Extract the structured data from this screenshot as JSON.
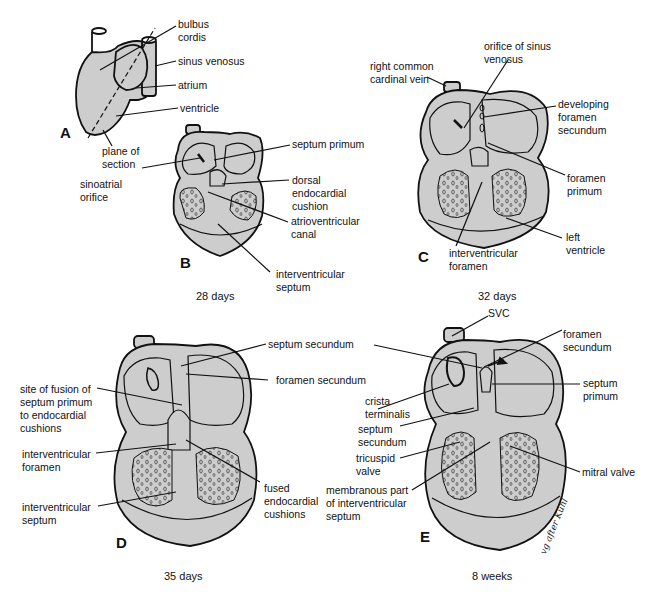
{
  "figure": {
    "fill_color": "#cdcdcd",
    "stroke_color": "#111111"
  },
  "panels": {
    "A": {
      "letter": "A",
      "labels": {
        "bulbus_cordis": "bulbus\ncordis",
        "sinus_venosus": "sinus venosus",
        "atrium": "atrium",
        "ventricle": "ventricle",
        "plane_of_section": "plane of\nsection"
      }
    },
    "B": {
      "letter": "B",
      "caption": "28 days",
      "labels": {
        "septum_primum": "septum primum",
        "sinoatrial_orifice": "sinoatrial\norifice",
        "dorsal_endocardial_cushion": "dorsal\nendocardial\ncushion",
        "atrioventricular_canal": "atrioventricular\ncanal",
        "interventricular_septum": "interventricular\nseptum"
      }
    },
    "C": {
      "letter": "C",
      "caption": "32 days",
      "labels": {
        "right_common_cardinal_vein": "right common\ncardinal vein",
        "orifice_of_sinus_venosus": "orifice of sinus\nvenosus",
        "developing_foramen_secundum": "developing\nforamen\nsecundum",
        "foramen_primum": "foramen\nprimum",
        "left_ventricle": "left\nventricle",
        "interventricular_foramen": "interventricular\nforamen"
      }
    },
    "D": {
      "letter": "D",
      "caption": "35 days",
      "labels": {
        "septum_secundum": "septum secundum",
        "foramen_secundum": "foramen secundum",
        "site_of_fusion": "site of fusion of\nseptum primum\nto endocardial\ncushions",
        "interventricular_foramen": "interventricular\nforamen",
        "interventricular_septum": "interventricular\nseptum",
        "fused_endocardial_cushions": "fused\nendocardial\ncushions"
      }
    },
    "E": {
      "letter": "E",
      "caption": "8 weeks",
      "signature": "vg after Kuhl",
      "labels": {
        "svc": "SVC",
        "foramen_secundum": "foramen\nsecundum",
        "septum_primum": "septum\nprimum",
        "crista_terminalis": "crista\nterminalis",
        "septum_secundum": "septum\nsecundum",
        "tricuspid_valve": "tricuspid\nvalve",
        "mitral_valve": "mitral valve",
        "membranous_part": "membranous part\nof interventricular\nseptum"
      }
    }
  }
}
